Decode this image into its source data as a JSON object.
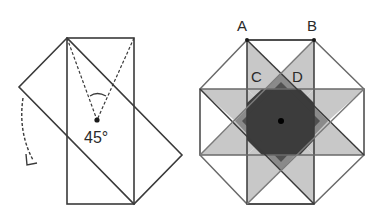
{
  "figures": {
    "left": {
      "description": "Rectangle rotated 45 degrees over a copy of itself about the corner",
      "angle_label": "45°",
      "rotation_arrow": "dashed curved arrow (clockwise)"
    },
    "right": {
      "description": "Octagon formed by overlapping rotated rectangles with shaded overlap regions",
      "labels": {
        "A": "A",
        "B": "B",
        "C": "C",
        "D": "D"
      }
    }
  },
  "colors": {
    "stroke": "#3a3a3a",
    "light_shade": "#c8c8c8",
    "mid_shade": "#8a8a8a",
    "dark_shade": "#3c3c3c",
    "background": "#ffffff"
  }
}
